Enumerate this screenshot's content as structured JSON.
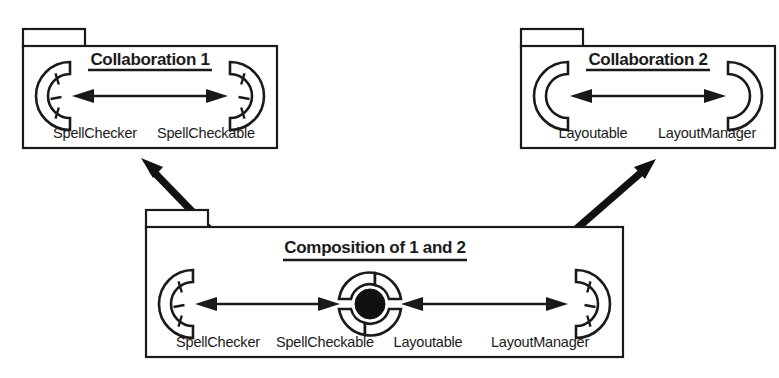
{
  "diagram": {
    "kind": "uml-collaboration-composition-diagram",
    "background_color": "#ffffff",
    "line_color": "#1a1a1a",
    "fill_color": "#111111"
  },
  "packages": [
    {
      "id": "collaboration-1",
      "title": "Collaboration 1",
      "left_role": "SpellChecker",
      "right_role": "SpellCheckable",
      "left_icon": "socket-segmented-icon",
      "right_icon": "socket-segmented-icon",
      "connector_icon": "double-arrow-icon"
    },
    {
      "id": "collaboration-2",
      "title": "Collaboration 2",
      "left_role": "Layoutable",
      "right_role": "LayoutManager",
      "left_icon": "socket-plain-icon",
      "right_icon": "socket-plain-icon",
      "connector_icon": "double-arrow-icon"
    },
    {
      "id": "composition",
      "title": "Composition of 1 and 2",
      "roles": [
        "SpellChecker",
        "SpellCheckable",
        "Layoutable",
        "LayoutManager"
      ],
      "left_icon": "socket-segmented-icon",
      "center_icon": "ball-and-socket-ring-icon",
      "right_icon": "socket-segmented-icon",
      "connector_icon": "double-arrow-icon"
    }
  ],
  "connectors": [
    {
      "id": "link-collab1-composition",
      "icon": "thick-double-arrow-icon",
      "from": "collaboration-1",
      "to": "composition"
    },
    {
      "id": "link-collab2-composition",
      "icon": "thick-double-arrow-icon",
      "from": "collaboration-2",
      "to": "composition"
    }
  ]
}
